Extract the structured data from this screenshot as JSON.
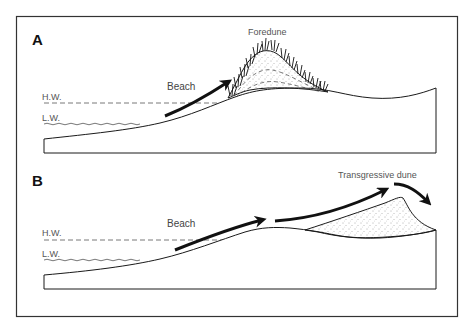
{
  "figure": {
    "panels": [
      {
        "id": "A",
        "letter": "A",
        "labels": {
          "high_water": "H.W.",
          "low_water": "L.W.",
          "beach": "Beach",
          "dune": "Foredune"
        }
      },
      {
        "id": "B",
        "letter": "B",
        "labels": {
          "high_water": "H.W.",
          "low_water": "L.W.",
          "beach": "Beach",
          "dune": "Transgressive dune"
        }
      }
    ],
    "colors": {
      "line": "#1a1a1a",
      "frame": "#333333",
      "text": "#444444",
      "background": "#ffffff"
    }
  }
}
